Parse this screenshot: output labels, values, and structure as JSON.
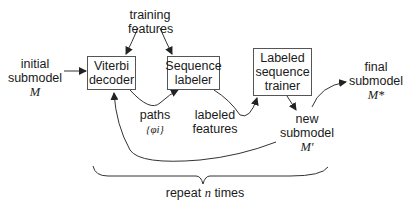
{
  "diagram": {
    "boxes": {
      "viterbi": [
        "Viterbi",
        "decoder"
      ],
      "labeler": [
        "Sequence",
        "labeler"
      ],
      "trainer": [
        "Labeled",
        "sequence",
        "trainer"
      ]
    },
    "labels": {
      "training_features": [
        "training",
        "features"
      ],
      "initial_submodel": [
        "initial",
        "submodel"
      ],
      "initial_symbol": "M",
      "paths": "paths",
      "paths_symbol": "{φi}",
      "labeled_features": [
        "labeled",
        "features"
      ],
      "new_submodel": [
        "new",
        "submodel"
      ],
      "new_symbol": "M′",
      "final_submodel": [
        "final",
        "submodel"
      ],
      "final_symbol": "M*",
      "repeat_prefix": "repeat",
      "repeat_n": "n",
      "repeat_suffix": "times"
    },
    "colors": {
      "stroke": "#333333",
      "box_border": "#555555",
      "text": "#1a1a1a"
    }
  }
}
